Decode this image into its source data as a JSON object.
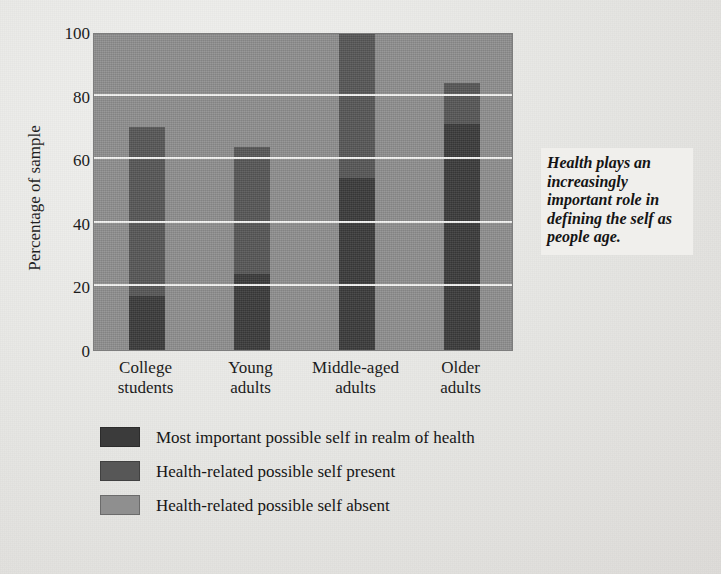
{
  "callout": {
    "text": "Health plays an increasingly important role in defining the self as people age."
  },
  "chart_data": {
    "type": "bar",
    "subtype": "stacked-100-percent",
    "title": "",
    "xlabel": "",
    "ylabel": "Percentage of sample",
    "ylim": [
      0,
      100
    ],
    "yticks": [
      0,
      20,
      40,
      60,
      80,
      100
    ],
    "ytick_labels": [
      "0",
      "20",
      "40",
      "60",
      "80",
      "100"
    ],
    "grid": "horizontal",
    "grid_color": "#f4f4f2",
    "legend_position": "below-plot",
    "categories": [
      "College students",
      "Young adults",
      "Middle-aged adults",
      "Older adults"
    ],
    "category_label_lines": [
      [
        "College",
        "students"
      ],
      [
        "Young",
        "adults"
      ],
      [
        "Middle-aged",
        "adults"
      ],
      [
        "Older",
        "adults"
      ]
    ],
    "series": [
      {
        "name": "Most important possible self in realm of health",
        "color": "#3b3b3b",
        "values": [
          17,
          24,
          54,
          71
        ]
      },
      {
        "name": "Health-related possible self present",
        "color": "#575757",
        "values": [
          53,
          40,
          46,
          13
        ]
      },
      {
        "name": "Health-related possible self absent",
        "color": "#8f8f8f",
        "values": [
          30,
          36,
          0,
          16
        ]
      }
    ],
    "cumulative_tops": [
      [
        17,
        70,
        100
      ],
      [
        24,
        64,
        100
      ],
      [
        54,
        100,
        100
      ],
      [
        71,
        84,
        100
      ]
    ]
  },
  "legend": {
    "items": [
      {
        "label": "Most important possible self in realm of health",
        "color": "#3b3b3b"
      },
      {
        "label": "Health-related possible self present",
        "color": "#575757"
      },
      {
        "label": "Health-related possible self absent",
        "color": "#8f8f8f"
      }
    ]
  },
  "colors": {
    "background": "#e9e9e7",
    "plot_background": "#8f8f8f",
    "gridline": "#f4f4f2",
    "dark": "#3b3b3b",
    "medium": "#575757",
    "light": "#8f8f8f",
    "text": "#1a1a1a"
  }
}
